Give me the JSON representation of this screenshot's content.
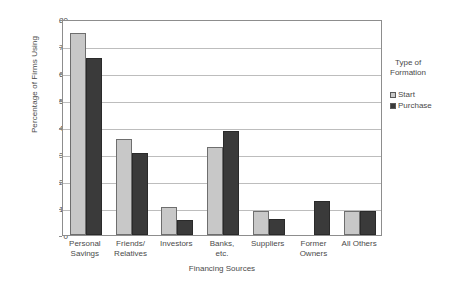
{
  "chart_data": {
    "type": "bar",
    "title": "",
    "xlabel": "Financing Sources",
    "ylabel": "Percentage of Firms Using",
    "ylim": [
      0,
      80
    ],
    "yticks": [
      0,
      10,
      20,
      30,
      40,
      50,
      60,
      70,
      80
    ],
    "grid": true,
    "legend_position": "right",
    "legend_title": "Type of Formation",
    "categories": [
      "Personal Savings",
      "Friends/ Relatives",
      "Investors",
      "Banks, etc.",
      "Suppliers",
      "Former Owners",
      "All Others"
    ],
    "category_lines": [
      [
        "Personal",
        "Savings"
      ],
      [
        "Friends/",
        "Relatives"
      ],
      [
        "Investors",
        ""
      ],
      [
        "Banks,",
        "etc."
      ],
      [
        "Suppliers",
        ""
      ],
      [
        "Former",
        "Owners"
      ],
      [
        "All Others",
        ""
      ]
    ],
    "series": [
      {
        "name": "Start",
        "color": "#c8c8c8",
        "values": [
          75.0,
          35.5,
          10.3,
          32.5,
          9.0,
          null,
          9.0
        ]
      },
      {
        "name": "Purchase",
        "color": "#3a3a3a",
        "values": [
          65.5,
          30.5,
          5.6,
          38.7,
          6.0,
          12.5,
          9.0
        ]
      }
    ]
  },
  "axes": {
    "y_title": "Percentage of Firms Using",
    "x_title": "Financing Sources"
  },
  "legend": {
    "title_line1": "Type of",
    "title_line2": "Formation",
    "items": [
      {
        "label": "Start",
        "color": "#c8c8c8"
      },
      {
        "label": "Purchase",
        "color": "#3a3a3a"
      }
    ]
  }
}
